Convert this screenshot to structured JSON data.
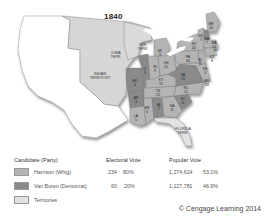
{
  "map": {
    "title": "1840",
    "territories": [
      {
        "label": "IOWA",
        "label2": "TERR.",
        "x": 116,
        "y": 54
      },
      {
        "label": "WIS.",
        "label2": "TERR.",
        "x": 143,
        "y": 46
      },
      {
        "label": "INDIAN",
        "label2": "TERRITORY",
        "x": 100,
        "y": 75
      },
      {
        "label": "FLORIDA",
        "label2": "TERR.",
        "x": 183,
        "y": 130
      }
    ],
    "states": [
      {
        "abbr": "ME",
        "ev": "10",
        "x": 211,
        "y": 25,
        "party": "whig"
      },
      {
        "abbr": "VT",
        "ev": "7",
        "x": 201,
        "y": 37,
        "party": "whig"
      },
      {
        "abbr": "NH",
        "ev": "7",
        "x": 207,
        "y": 40,
        "party": "democrat"
      },
      {
        "abbr": "MA",
        "ev": "14",
        "x": 214,
        "y": 44,
        "party": "whig"
      },
      {
        "abbr": "RI",
        "ev": "4",
        "x": 216,
        "y": 52,
        "party": "whig"
      },
      {
        "abbr": "CT",
        "ev": "8",
        "x": 212,
        "y": 58,
        "party": "whig"
      },
      {
        "abbr": "NY",
        "ev": "42",
        "x": 194,
        "y": 45,
        "party": "whig"
      },
      {
        "abbr": "PA",
        "ev": "30",
        "x": 188,
        "y": 58,
        "party": "whig"
      },
      {
        "abbr": "NJ",
        "ev": "8",
        "x": 200,
        "y": 61,
        "party": "whig"
      },
      {
        "abbr": "DE",
        "ev": "3",
        "x": 205,
        "y": 70,
        "party": "whig"
      },
      {
        "abbr": "MD",
        "ev": "10",
        "x": 207,
        "y": 82,
        "party": "whig"
      },
      {
        "abbr": "MI",
        "ev": "3",
        "x": 160,
        "y": 52,
        "party": "whig"
      },
      {
        "abbr": "OH",
        "ev": "21",
        "x": 166,
        "y": 64,
        "party": "whig"
      },
      {
        "abbr": "IN",
        "ev": "9",
        "x": 155,
        "y": 68,
        "party": "whig"
      },
      {
        "abbr": "IL",
        "ev": "5",
        "x": 145,
        "y": 70,
        "party": "democrat"
      },
      {
        "abbr": "MO",
        "ev": "4",
        "x": 135,
        "y": 82,
        "party": "democrat"
      },
      {
        "abbr": "KY",
        "ev": "15",
        "x": 161,
        "y": 81,
        "party": "whig"
      },
      {
        "abbr": "VA",
        "ev": "23",
        "x": 183,
        "y": 76,
        "party": "democrat"
      },
      {
        "abbr": "NC",
        "ev": "15",
        "x": 186,
        "y": 89,
        "party": "whig"
      },
      {
        "abbr": "TN",
        "ev": "15",
        "x": 158,
        "y": 92,
        "party": "whig"
      },
      {
        "abbr": "SC",
        "ev": "11",
        "x": 183,
        "y": 100,
        "party": "democrat"
      },
      {
        "abbr": "AR",
        "ev": "3",
        "x": 136,
        "y": 99,
        "party": "democrat"
      },
      {
        "abbr": "MS",
        "ev": "4",
        "x": 147,
        "y": 109,
        "party": "whig"
      },
      {
        "abbr": "AL",
        "ev": "7",
        "x": 159,
        "y": 106,
        "party": "democrat"
      },
      {
        "abbr": "GA",
        "ev": "11",
        "x": 172,
        "y": 107,
        "party": "whig"
      },
      {
        "abbr": "LA",
        "ev": "5",
        "x": 136,
        "y": 117,
        "party": "whig"
      }
    ]
  },
  "legend": {
    "headers": {
      "candidate": "Candidate (Party)",
      "electoral": "Electoral Vote",
      "popular": "Popular Vote"
    },
    "rows": [
      {
        "label": "Harrison (Whig)",
        "color": "#b4b4b4",
        "ev": "234",
        "ev_pct": "80%",
        "pop": "1,274,624",
        "pop_pct": "53.1%"
      },
      {
        "label": "Van Buren (Democrat)",
        "color": "#8a8a8a",
        "ev": "60",
        "ev_pct": "20%",
        "pop": "1,127,781",
        "pop_pct": "46.9%"
      },
      {
        "label": "Territories",
        "color": "#e2e2e2"
      }
    ],
    "credit": "© Cengage Learning 2014"
  },
  "colors": {
    "whig": "#b4b4b4",
    "democrat": "#8a8a8a",
    "territory": "#d6d6d6",
    "unorganized": "#ffffff",
    "water": "#ffffff"
  }
}
